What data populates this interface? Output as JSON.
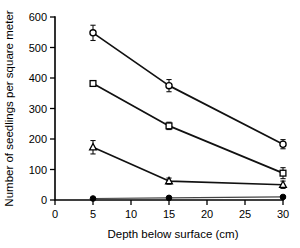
{
  "chart_data": {
    "type": "line",
    "title": "",
    "subtitle": "",
    "xlabel": "Depth below surface (cm)",
    "ylabel": "Number of seedlings per square meter",
    "x": [
      5,
      15,
      30
    ],
    "xlim": [
      0,
      30
    ],
    "ylim": [
      0,
      600
    ],
    "xticks": [
      0,
      5,
      10,
      15,
      20,
      25,
      30
    ],
    "xtick_labels": [
      "0",
      "5",
      "10",
      "15",
      "20",
      "25",
      "30"
    ],
    "yticks": [
      0,
      100,
      200,
      300,
      400,
      500,
      600
    ],
    "ytick_labels": [
      "0",
      "100",
      "200",
      "300",
      "400",
      "500",
      "600"
    ],
    "grid": false,
    "legend": "none",
    "error_bars": "yes",
    "series": [
      {
        "name": "open-circle-series",
        "marker": "open-circle",
        "values": [
          548,
          375,
          183
        ],
        "errors": [
          25,
          20,
          15
        ]
      },
      {
        "name": "open-square-series",
        "marker": "open-square",
        "values": [
          382,
          243,
          88
        ],
        "errors": [
          8,
          12,
          18
        ]
      },
      {
        "name": "open-triangle-series",
        "marker": "open-triangle",
        "values": [
          173,
          62,
          50
        ],
        "errors": [
          22,
          10,
          12
        ]
      },
      {
        "name": "filled-circle-series",
        "marker": "filled-circle",
        "values": [
          5,
          7,
          10
        ],
        "errors": [
          0,
          0,
          3
        ]
      }
    ],
    "colors": {
      "axis": "#000000",
      "line": "#111111",
      "marker_fill": "#ffffff",
      "marker_edge": "#000000",
      "background": "#ffffff"
    }
  }
}
